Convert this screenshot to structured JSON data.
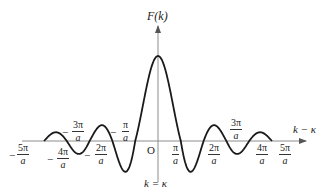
{
  "figure": {
    "y_axis_label": "F(k)",
    "x_axis_label": "k − κ",
    "origin_label": "O",
    "vertical_line_label": "k = κ",
    "colors": {
      "curve": "#1a1a1a",
      "axis": "#8c8c8c",
      "text": "#222222"
    }
  },
  "ticks": [
    {
      "id": "m5",
      "sign": "−",
      "num": "5π",
      "den": "a"
    },
    {
      "id": "m4",
      "sign": "−",
      "num": "4π",
      "den": "a"
    },
    {
      "id": "m3",
      "sign": "−",
      "num": "3π",
      "den": "a"
    },
    {
      "id": "m2",
      "sign": "−",
      "num": "2π",
      "den": "a"
    },
    {
      "id": "m1",
      "sign": "−",
      "num": "π",
      "den": "a"
    },
    {
      "id": "p1",
      "sign": "",
      "num": "π",
      "den": "a"
    },
    {
      "id": "p2",
      "sign": "",
      "num": "2π",
      "den": "a"
    },
    {
      "id": "p3",
      "sign": "",
      "num": "3π",
      "den": "a"
    },
    {
      "id": "p4",
      "sign": "",
      "num": "4π",
      "den": "a"
    },
    {
      "id": "p5",
      "sign": "",
      "num": "5π",
      "den": "a"
    }
  ],
  "chart_data": {
    "type": "line",
    "title": "",
    "xlabel": "k − κ",
    "ylabel": "F(k)",
    "x_ticks": [
      "-5π/a",
      "-4π/a",
      "-3π/a",
      "-2π/a",
      "-π/a",
      "O",
      "π/a",
      "2π/a",
      "3π/a",
      "4π/a",
      "5π/a"
    ],
    "zeros": [
      "±π/a",
      "±2π/a",
      "±3π/a",
      "±4π/a",
      "±5π/a"
    ],
    "xlim": [
      "-5π/a",
      "5π/a"
    ],
    "grid": false
  }
}
